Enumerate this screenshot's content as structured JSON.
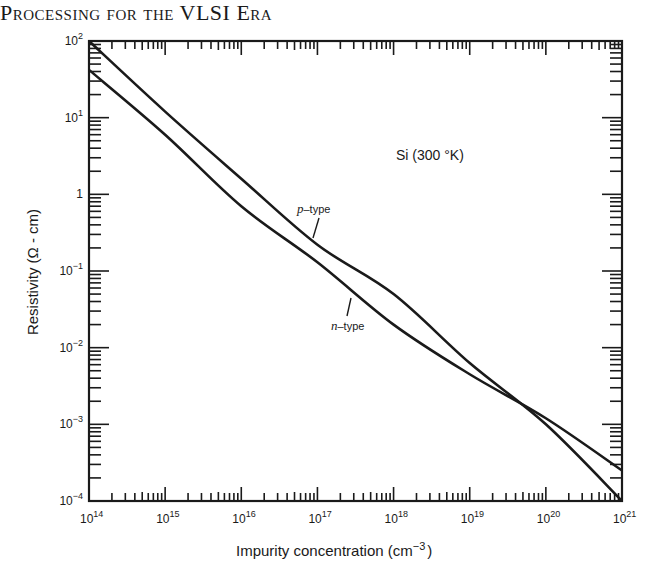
{
  "page": {
    "header_text": "Processing for the VLSI Era"
  },
  "chart_data": {
    "type": "line",
    "title": "",
    "xlabel": "Impurity concentration (cm^-3)",
    "ylabel": "Resistivity (Ω - cm)",
    "xscale": "log",
    "yscale": "log",
    "xlim": [
      100000000000000.0,
      1e+21
    ],
    "ylim": [
      0.0001,
      100.0
    ],
    "x_ticks": [
      "10^14",
      "10^15",
      "10^16",
      "10^17",
      "10^18",
      "10^19",
      "10^20",
      "10^21"
    ],
    "y_ticks": [
      "10^2",
      "10^1",
      "1",
      "10^-1",
      "10^-2",
      "10^-3",
      "10^-4"
    ],
    "grid": false,
    "annotations": [
      {
        "text": "Si (300 °K)",
        "x": 5e+19,
        "y": 10
      },
      {
        "text": "p-type",
        "x": 1.2e+17,
        "y": 0.6
      },
      {
        "text": "n-type",
        "x": 3.5e+17,
        "y": 0.02
      }
    ],
    "x": [
      100000000000000.0,
      1000000000000000.0,
      1e+16,
      1e+17,
      1e+18,
      1e+19,
      1e+20,
      1e+21
    ],
    "series": [
      {
        "name": "p-type",
        "values": [
          100,
          12,
          1.6,
          0.22,
          0.05,
          0.0063,
          0.001,
          0.0001
        ]
      },
      {
        "name": "n-type",
        "values": [
          42,
          6,
          0.7,
          0.13,
          0.02,
          0.0045,
          0.0012,
          0.00025
        ]
      }
    ]
  },
  "labels": {
    "x_title_main": "Impurity concentration (cm",
    "x_title_exp": "−3",
    "x_title_close": ")",
    "y_title": "Resistivity (Ω - cm)",
    "material": "Si (300 °K)",
    "p_label_italic": "p",
    "p_label_rest": "–type",
    "n_label_italic": "n",
    "n_label_rest": "–type",
    "x_tick_labels": [
      {
        "base": "10",
        "exp": "14"
      },
      {
        "base": "10",
        "exp": "15"
      },
      {
        "base": "10",
        "exp": "16"
      },
      {
        "base": "10",
        "exp": "17"
      },
      {
        "base": "10",
        "exp": "18"
      },
      {
        "base": "10",
        "exp": "19"
      },
      {
        "base": "10",
        "exp": "20"
      },
      {
        "base": "10",
        "exp": "21"
      }
    ],
    "y_tick_labels": [
      {
        "base": "10",
        "exp": "2"
      },
      {
        "base": "10",
        "exp": "1"
      },
      {
        "base": "1",
        "exp": ""
      },
      {
        "base": "10",
        "exp": "−1"
      },
      {
        "base": "10",
        "exp": "−2"
      },
      {
        "base": "10",
        "exp": "−3"
      },
      {
        "base": "10",
        "exp": "−4"
      }
    ]
  }
}
